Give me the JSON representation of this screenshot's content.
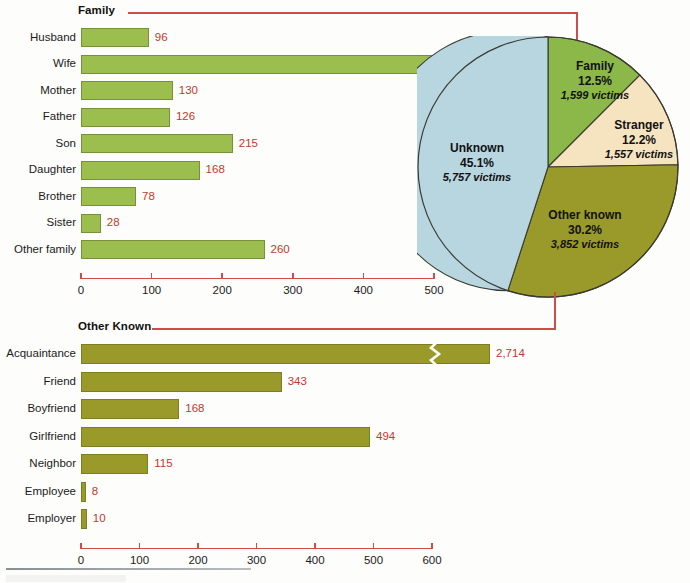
{
  "figure": {
    "background_color": "#fdfdfc",
    "accent_line_color": "#d14b4b",
    "value_label_color": "#c3382c"
  },
  "sections": {
    "family_title": "Family",
    "other_known_title": "Other Known"
  },
  "chart_data": [
    {
      "id": "family-bar-chart",
      "type": "bar",
      "orientation": "horizontal",
      "title": "Family",
      "xlabel": "",
      "ylabel": "",
      "xlim": [
        0,
        500
      ],
      "xticks": [
        0,
        100,
        200,
        300,
        400,
        500
      ],
      "xtick_labels": [
        "0",
        "100",
        "200",
        "300",
        "400",
        "500"
      ],
      "grid": false,
      "legend": "none",
      "bar_color": "#9cbe4f",
      "bar_edge_color": "#76913a",
      "categories": [
        "Husband",
        "Wife",
        "Mother",
        "Father",
        "Son",
        "Daughter",
        "Brother",
        "Sister",
        "Other family"
      ],
      "values": [
        96,
        498,
        130,
        126,
        215,
        168,
        78,
        28,
        260
      ],
      "value_labels": [
        "96",
        "498",
        "130",
        "126",
        "215",
        "168",
        "78",
        "28",
        "260"
      ]
    },
    {
      "id": "pie-chart-victim-offender-relationship",
      "type": "pie",
      "title": "",
      "legend": "labels-on-slices",
      "slices": [
        {
          "label": "Family",
          "percent": 12.5,
          "percent_label": "12.5%",
          "victims": 1599,
          "victims_label": "1,599 victims",
          "color": "#8cb84a"
        },
        {
          "label": "Stranger",
          "percent": 12.2,
          "percent_label": "12.2%",
          "victims": 1557,
          "victims_label": "1,557 victims",
          "color": "#f6e4c1"
        },
        {
          "label": "Other known",
          "percent": 30.2,
          "percent_label": "30.2%",
          "victims": 3852,
          "victims_label": "3,852 victims",
          "color": "#9a9a2a"
        },
        {
          "label": "Unknown",
          "percent": 45.1,
          "percent_label": "45.1%",
          "victims": 5757,
          "victims_label": "5,757 victims",
          "color": "#b7d6e0"
        }
      ]
    },
    {
      "id": "other-known-bar-chart",
      "type": "bar",
      "orientation": "horizontal",
      "title": "Other Known",
      "xlabel": "",
      "ylabel": "",
      "xlim": [
        0,
        600
      ],
      "xticks": [
        0,
        100,
        200,
        300,
        400,
        500,
        600
      ],
      "xtick_labels": [
        "0",
        "100",
        "200",
        "300",
        "400",
        "500",
        "600"
      ],
      "grid": false,
      "legend": "none",
      "bar_color": "#9a9a2a",
      "bar_edge_color": "#7d7d22",
      "categories": [
        "Acquaintance",
        "Friend",
        "Boyfriend",
        "Girlfriend",
        "Neighbor",
        "Employee",
        "Employer"
      ],
      "values": [
        2714,
        343,
        168,
        494,
        115,
        8,
        10
      ],
      "value_labels": [
        "2,714",
        "343",
        "168",
        "494",
        "115",
        "8",
        "10"
      ],
      "axis_break": {
        "category": "Acquaintance",
        "note": "bar truncated with zigzag break mark"
      }
    }
  ],
  "family_chart": {
    "rows": [
      {
        "label": "Husband",
        "value": 96,
        "value_label": "96"
      },
      {
        "label": "Wife",
        "value": 498,
        "value_label": "498"
      },
      {
        "label": "Mother",
        "value": 130,
        "value_label": "130"
      },
      {
        "label": "Father",
        "value": 126,
        "value_label": "126"
      },
      {
        "label": "Son",
        "value": 215,
        "value_label": "215"
      },
      {
        "label": "Daughter",
        "value": 168,
        "value_label": "168"
      },
      {
        "label": "Brother",
        "value": 78,
        "value_label": "78"
      },
      {
        "label": "Sister",
        "value": 28,
        "value_label": "28"
      },
      {
        "label": "Other family",
        "value": 260,
        "value_label": "260"
      }
    ],
    "ticks": [
      "0",
      "100",
      "200",
      "300",
      "400",
      "500"
    ]
  },
  "other_known_chart": {
    "rows": [
      {
        "label": "Acquaintance",
        "value": 2714,
        "value_label": "2,714",
        "broken": true
      },
      {
        "label": "Friend",
        "value": 343,
        "value_label": "343",
        "broken": false
      },
      {
        "label": "Boyfriend",
        "value": 168,
        "value_label": "168",
        "broken": false
      },
      {
        "label": "Girlfriend",
        "value": 494,
        "value_label": "494",
        "broken": false
      },
      {
        "label": "Neighbor",
        "value": 115,
        "value_label": "115",
        "broken": false
      },
      {
        "label": "Employee",
        "value": 8,
        "value_label": "8",
        "broken": false
      },
      {
        "label": "Employer",
        "value": 10,
        "value_label": "10",
        "broken": false
      }
    ],
    "ticks": [
      "0",
      "100",
      "200",
      "300",
      "400",
      "500",
      "600"
    ]
  },
  "pie": {
    "slices": [
      {
        "name": "Family",
        "percent": "12.5%",
        "victims": "1,599 victims"
      },
      {
        "name": "Stranger",
        "percent": "12.2%",
        "victims": "1,557 victims"
      },
      {
        "name": "Other known",
        "percent": "30.2%",
        "victims": "3,852 victims"
      },
      {
        "name": "Unknown",
        "percent": "45.1%",
        "victims": "5,757 victims"
      }
    ]
  }
}
